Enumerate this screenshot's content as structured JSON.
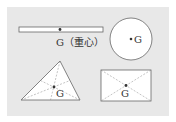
{
  "figure": {
    "background_color": "#e8e8e8",
    "stroke_color": "#555555",
    "fill_color": "#ffffff",
    "bar": {
      "label": "G（重心）",
      "point_label": "G"
    },
    "circle": {
      "label": "G"
    },
    "triangle": {
      "label": "G"
    },
    "rectangle": {
      "label": "G"
    }
  }
}
